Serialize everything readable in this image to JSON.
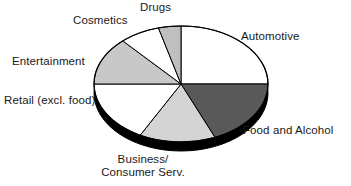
{
  "chart_data": {
    "type": "pie",
    "title": "",
    "subtitle": "",
    "xlabel": "",
    "ylabel": "",
    "grid": false,
    "legend_position": "none",
    "label_placement": "outside",
    "three_d": true,
    "start_angle_deg": 0,
    "direction": "clockwise",
    "center": {
      "x": 181,
      "y": 84
    },
    "radius_x": 87,
    "radius_y": 58,
    "depth": 9,
    "categories": [
      "Automotive",
      "Food and Alcohol",
      "Business/ Consumer Serv.",
      "Retail (excl. food)",
      "Entertainment",
      "Cosmetics",
      "Drugs"
    ],
    "values": [
      25.0,
      18.6,
      14.2,
      17.2,
      13.3,
      7.5,
      4.2
    ],
    "slices": [
      {
        "label": "Automotive",
        "value": 25.0,
        "start_deg": 0,
        "end_deg": 90,
        "color": "#ffffff",
        "label_text": "Automotive"
      },
      {
        "label": "Food and Alcohol",
        "value": 18.6,
        "start_deg": 90,
        "end_deg": 157,
        "color": "#595959",
        "label_text": "Food and Alcohol"
      },
      {
        "label": "Business/ Consumer Serv.",
        "value": 14.2,
        "start_deg": 157,
        "end_deg": 208,
        "color": "#d4d4d4",
        "label_text_line1": "Business/",
        "label_text_line2": "Consumer Serv."
      },
      {
        "label": "Retail (excl. food)",
        "value": 17.2,
        "start_deg": 208,
        "end_deg": 270,
        "color": "#ffffff",
        "label_text": "Retail (excl. food)"
      },
      {
        "label": "Entertainment",
        "value": 13.3,
        "start_deg": 270,
        "end_deg": 318,
        "color": "#c8c8c8",
        "label_text": "Entertainment"
      },
      {
        "label": "Cosmetics",
        "value": 7.5,
        "start_deg": 318,
        "end_deg": 345,
        "color": "#ffffff",
        "label_text": "Cosmetics"
      },
      {
        "label": "Drugs",
        "value": 4.2,
        "start_deg": 345,
        "end_deg": 360,
        "color": "#bfbfbf",
        "label_text": "Drugs"
      }
    ],
    "colors": {
      "outline": "#000000",
      "base_shadow": "#000000",
      "background": "#ffffff",
      "label_text": "#1a1a1a"
    }
  }
}
